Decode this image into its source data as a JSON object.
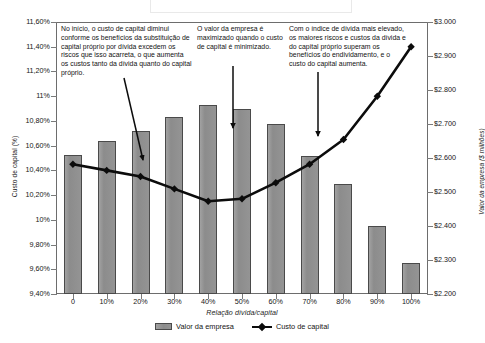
{
  "chart_data": {
    "type": "bar",
    "title": "",
    "xlabel": "Relação dívida/capital",
    "ylabel": "Custo de capital (%)",
    "y2label": "Valor da empresa ($ milhões)",
    "categories": [
      "0",
      "10%",
      "20%",
      "30%",
      "40%",
      "50%",
      "60%",
      "70%",
      "80%",
      "90%",
      "100%"
    ],
    "ylim": [
      9.4,
      11.6
    ],
    "y2lim": [
      2200,
      3000
    ],
    "grid": false,
    "legend_position": "bottom",
    "series": [
      {
        "name": "Valor da empresa",
        "type": "bar",
        "axis": "right",
        "color": "#8e8e8e",
        "values": [
          2610,
          2650,
          2680,
          2720,
          2755,
          2745,
          2700,
          2605,
          2525,
          2400,
          2290
        ]
      },
      {
        "name": "Custo de capital",
        "type": "line",
        "axis": "left",
        "color": "#0c0c0c",
        "values": [
          10.45,
          10.4,
          10.35,
          10.25,
          10.15,
          10.17,
          10.3,
          10.45,
          10.65,
          11.0,
          11.4
        ]
      }
    ],
    "y_ticks_left": [
      "9,40%",
      "9,60%",
      "9,80%",
      "10%",
      "10,20%",
      "10,40%",
      "10,60%",
      "10,80%",
      "11%",
      "11,20%",
      "11,40%",
      "11,60%"
    ],
    "y_ticks_right": [
      "$2.200",
      "$2.300",
      "$2.400",
      "$2.500",
      "$2.600",
      "$2.700",
      "$2.800",
      "$2.900",
      "$3.000"
    ],
    "annotations": [
      "No início, o custo de capital diminui conforme os benefícios da substituição de capital próprio por dívida excedem os riscos que isso acarreta, o que aumenta os custos tanto da dívida quanto do capital próprio.",
      "O valor da empresa é maximizado quando o custo de capital é minimizado.",
      "Com o índice de dívida mais elevado, os maiores riscos e custos da dívida e do capital próprio superam os benefícios do endividamento, e o custo do capital aumenta."
    ]
  },
  "legend": {
    "items": [
      {
        "label": "Valor da empresa",
        "icon": "bar-swatch"
      },
      {
        "label": "Custo de capital",
        "icon": "line-swatch"
      }
    ]
  }
}
